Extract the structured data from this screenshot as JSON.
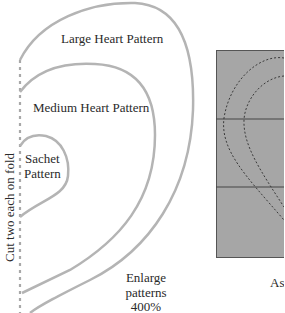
{
  "diagram": {
    "left_panel": {
      "labels": {
        "large": "Large Heart Pattern",
        "medium": "Medium Heart Pattern",
        "sachet_line1": "Sachet",
        "sachet_line2": "Pattern",
        "fold_note": "Cut two each on fold",
        "enlarge_line1": "Enlarge",
        "enlarge_line2": "patterns",
        "enlarge_line3": "400%"
      },
      "colors": {
        "outline": "#b4b4b4",
        "fold_line": "#a8a8a8",
        "text": "#2a2a2a"
      }
    },
    "right_panel": {
      "caption_partial": "As",
      "colors": {
        "fill": "#a6a6a6",
        "border": "#555555",
        "dashed": "#3a3a3a"
      }
    }
  }
}
